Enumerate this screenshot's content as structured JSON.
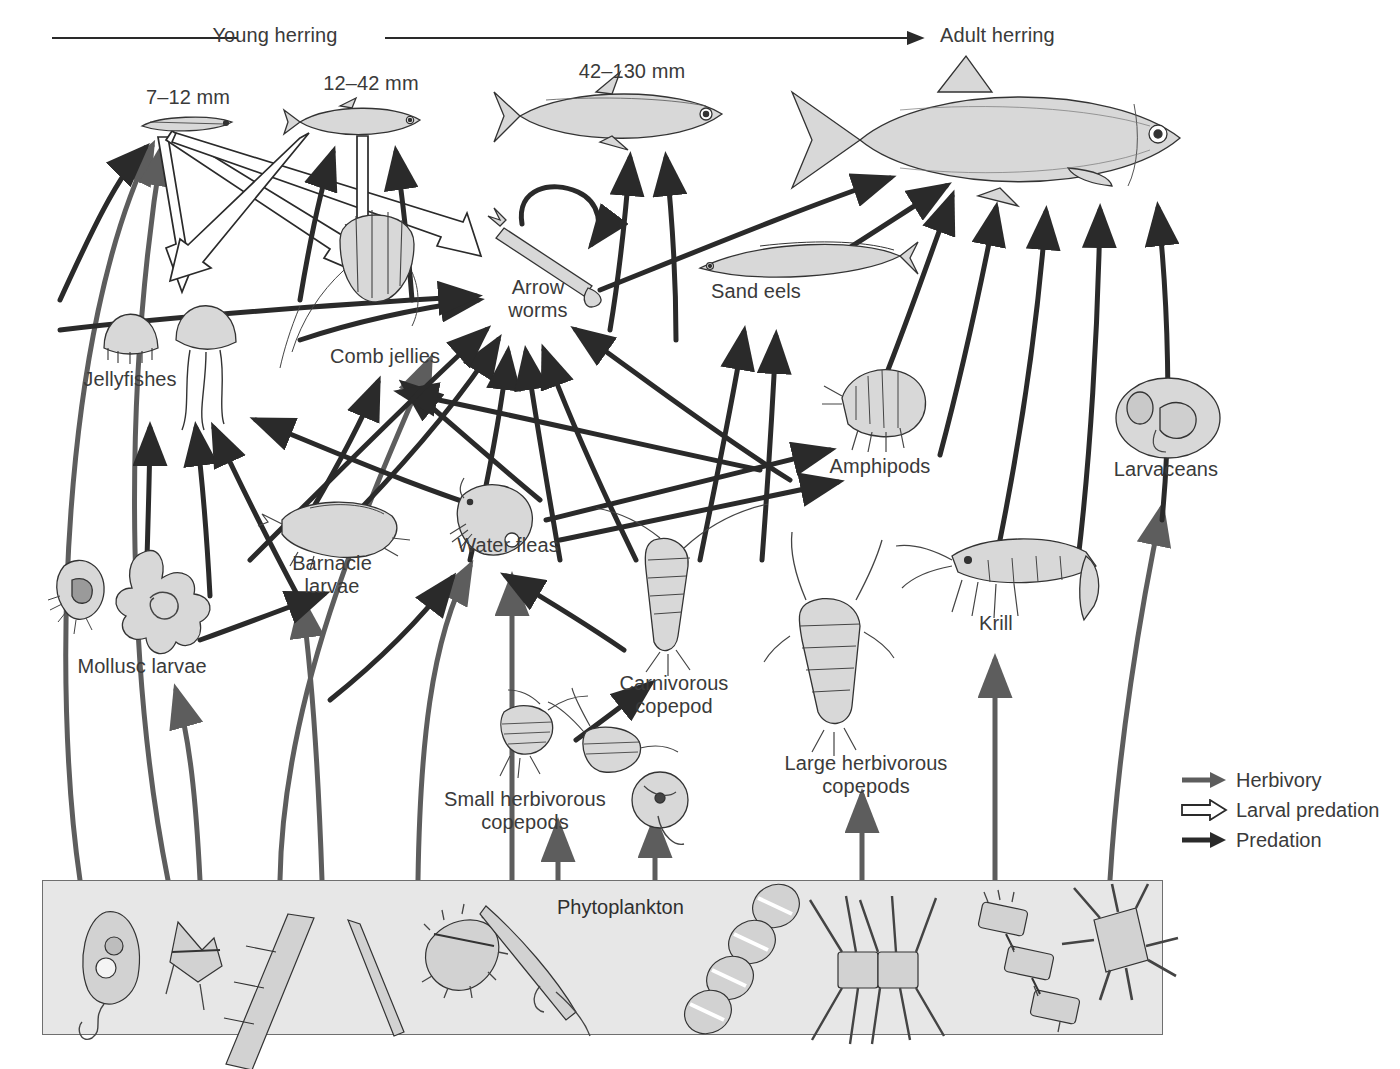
{
  "diagram": {
    "top_axis": {
      "left_label": "Young herring",
      "right_label": "Adult herring"
    },
    "stage_labels": [
      {
        "text": "7–12 mm",
        "x": 188,
        "y": 88
      },
      {
        "text": "12–42 mm",
        "x": 371,
        "y": 74
      },
      {
        "text": "42–130 mm",
        "x": 632,
        "y": 62
      }
    ],
    "nodes": [
      {
        "id": "herring_7_12",
        "label": "7–12 mm",
        "x": 188,
        "y": 126
      },
      {
        "id": "herring_12_42",
        "label": "12–42 mm",
        "x": 365,
        "y": 120
      },
      {
        "id": "herring_42_130",
        "label": "42–130 mm",
        "x": 620,
        "y": 115
      },
      {
        "id": "adult_herring",
        "label": "Adult herring",
        "x": 1000,
        "y": 135
      },
      {
        "id": "jellyfishes",
        "label": "Jellyfishes",
        "x": 130,
        "y": 380
      },
      {
        "id": "comb_jellies",
        "label": "Comb jellies",
        "x": 385,
        "y": 358
      },
      {
        "id": "arrow_worms",
        "label": "Arrow\nworms",
        "x": 538,
        "y": 298
      },
      {
        "id": "sand_eels",
        "label": "Sand eels",
        "x": 756,
        "y": 293
      },
      {
        "id": "amphipods",
        "label": "Amphipods",
        "x": 880,
        "y": 465
      },
      {
        "id": "larvaceans",
        "label": "Larvaceans",
        "x": 1166,
        "y": 470
      },
      {
        "id": "barnacle",
        "label": "Barnacle\nlarvae",
        "x": 330,
        "y": 575
      },
      {
        "id": "water_fleas",
        "label": "Water fleas",
        "x": 508,
        "y": 546
      },
      {
        "id": "mollusc",
        "label": "Mollusc larvae",
        "x": 142,
        "y": 667
      },
      {
        "id": "carniv_cop",
        "label": "Carnivorous\ncopepod",
        "x": 674,
        "y": 693
      },
      {
        "id": "krill",
        "label": "Krill",
        "x": 996,
        "y": 625
      },
      {
        "id": "large_herb",
        "label": "Large herbivorous\ncopepods",
        "x": 866,
        "y": 775
      },
      {
        "id": "small_herb",
        "label": "Small herbivorous\ncopepods",
        "x": 525,
        "y": 810
      },
      {
        "id": "phytoplankton",
        "label": "Phytoplankton",
        "x": 625,
        "y": 908
      }
    ],
    "legend": {
      "items": [
        {
          "key": "herbivory",
          "label": "Herbivory",
          "style": "gray-solid-arrow",
          "color": "#5a5a5a"
        },
        {
          "key": "larval-predation",
          "label": "Larval predation",
          "style": "hollow-open-arrow",
          "color": "#ffffff"
        },
        {
          "key": "predation",
          "label": "Predation",
          "style": "black-solid-arrow",
          "color": "#1e1e1e"
        }
      ]
    },
    "colors": {
      "herbivory": "#5d5d5d",
      "predation": "#2a2a2a",
      "larval_predation_fill": "#ffffff",
      "larval_predation_stroke": "#2a2a2a",
      "phyto_box_fill": "#e7e7e7",
      "phyto_box_stroke": "#6f6f6f",
      "text": "#3a3a3a"
    },
    "phytoplankton_box": {
      "label": "Phytoplankton",
      "organism_count": 11
    }
  }
}
